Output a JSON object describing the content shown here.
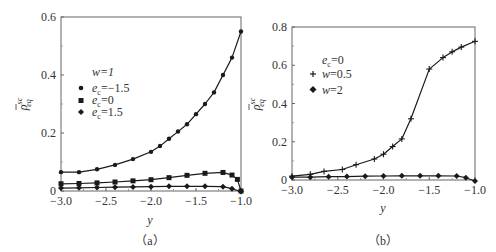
{
  "chart_data": [
    {
      "panel": "a",
      "type": "line",
      "caption": "（a）",
      "xlabel": "y",
      "ylabel": "ρ̄ sc eq",
      "xlim": [
        -3.0,
        -1.0
      ],
      "ylim": [
        0,
        0.6
      ],
      "xticks": [
        -3.0,
        -2.5,
        -2.0,
        -1.5,
        -1.0
      ],
      "xtick_labels": [
        "−3.0",
        "−2.5",
        "−2.0",
        "−1.5",
        "−1.0"
      ],
      "yticks": [
        0,
        0.2,
        0.4,
        0.6
      ],
      "ytick_labels": [
        "0",
        "0.2",
        "0.4",
        "0.6"
      ],
      "grid": false,
      "legend": {
        "title": "w=1",
        "position": "upper-left"
      },
      "series": [
        {
          "name": "ec=−1.5",
          "marker": "circle",
          "x": [
            -3.0,
            -2.8,
            -2.6,
            -2.4,
            -2.2,
            -2.0,
            -1.9,
            -1.8,
            -1.7,
            -1.6,
            -1.5,
            -1.4,
            -1.3,
            -1.2,
            -1.1,
            -1.0
          ],
          "values": [
            0.065,
            0.065,
            0.075,
            0.09,
            0.11,
            0.135,
            0.155,
            0.18,
            0.205,
            0.23,
            0.265,
            0.3,
            0.34,
            0.4,
            0.46,
            0.55
          ]
        },
        {
          "name": "ec=0",
          "marker": "square",
          "x": [
            -3.0,
            -2.8,
            -2.6,
            -2.4,
            -2.2,
            -2.0,
            -1.8,
            -1.6,
            -1.4,
            -1.2,
            -1.1,
            -1.04,
            -1.0
          ],
          "values": [
            0.025,
            0.026,
            0.028,
            0.031,
            0.035,
            0.039,
            0.046,
            0.054,
            0.061,
            0.064,
            0.055,
            0.04,
            0.0
          ]
        },
        {
          "name": "ec=1.5",
          "marker": "diamond",
          "x": [
            -3.0,
            -2.8,
            -2.6,
            -2.4,
            -2.2,
            -2.0,
            -1.8,
            -1.6,
            -1.4,
            -1.2,
            -1.1,
            -1.0
          ],
          "values": [
            0.01,
            0.011,
            0.012,
            0.013,
            0.014,
            0.015,
            0.016,
            0.016,
            0.016,
            0.015,
            0.008,
            -0.002
          ]
        }
      ]
    },
    {
      "panel": "b",
      "type": "line",
      "caption": "（b）",
      "xlabel": "y",
      "ylabel": "ρ̄ sc eq",
      "xlim": [
        -3.0,
        -1.0
      ],
      "ylim": [
        0,
        0.8
      ],
      "xticks": [
        -3.0,
        -2.5,
        -2.0,
        -1.5,
        -1.0
      ],
      "xtick_labels": [
        "−3.0",
        "−2.5",
        "−2.0",
        "−1.5",
        "−1.0"
      ],
      "yticks": [
        0,
        0.2,
        0.4,
        0.6,
        0.8
      ],
      "ytick_labels": [
        "0",
        "0.2",
        "0.4",
        "0.6",
        "0.8"
      ],
      "grid": false,
      "legend": {
        "title": "ec=0",
        "position": "upper-left"
      },
      "series": [
        {
          "name": "w=0.5",
          "marker": "plus",
          "x": [
            -3.0,
            -2.8,
            -2.65,
            -2.45,
            -2.3,
            -2.1,
            -2.0,
            -1.9,
            -1.8,
            -1.7,
            -1.5,
            -1.35,
            -1.25,
            -1.15,
            -1.0
          ],
          "values": [
            0.02,
            0.03,
            0.045,
            0.055,
            0.08,
            0.11,
            0.135,
            0.175,
            0.215,
            0.32,
            0.58,
            0.64,
            0.67,
            0.695,
            0.725
          ]
        },
        {
          "name": "w=2",
          "marker": "diamond",
          "x": [
            -3.0,
            -2.8,
            -2.6,
            -2.4,
            -2.2,
            -2.0,
            -1.8,
            -1.6,
            -1.4,
            -1.2,
            -1.1,
            -1.0
          ],
          "values": [
            0.015,
            0.015,
            0.017,
            0.018,
            0.02,
            0.021,
            0.022,
            0.022,
            0.022,
            0.021,
            0.012,
            -0.005
          ]
        }
      ]
    }
  ],
  "panels": {
    "a": {
      "caption": "（a）",
      "xlabel": "y",
      "ylabel_main": "ρ",
      "ylabel_sup": "sc",
      "ylabel_sub": "eq",
      "legend_title": "w=1",
      "legend_items": [
        {
          "label_base": "e",
          "label_sub": "c",
          "label_rest": "=−1.5"
        },
        {
          "label_base": "e",
          "label_sub": "c",
          "label_rest": "=0"
        },
        {
          "label_base": "e",
          "label_sub": "c",
          "label_rest": "=1.5"
        }
      ],
      "xtick_labels": [
        "−3.0",
        "−2.5",
        "−2.0",
        "−1.5",
        "−1.0"
      ],
      "ytick_labels": [
        "0",
        "0.2",
        "0.4",
        "0.6"
      ]
    },
    "b": {
      "caption": "（b）",
      "xlabel": "y",
      "ylabel_main": "ρ",
      "ylabel_sup": "sc",
      "ylabel_sub": "eq",
      "legend_title_base": "e",
      "legend_title_sub": "c",
      "legend_title_rest": "=0",
      "legend_items": [
        {
          "label_italic": "w",
          "label_rest": "=0.5"
        },
        {
          "label_italic": "w",
          "label_rest": "=2"
        }
      ],
      "xtick_labels": [
        "−3.0",
        "−2.5",
        "−2.0",
        "−1.5",
        "−1.0"
      ],
      "ytick_labels": [
        "0",
        "0.2",
        "0.4",
        "0.6",
        "0.8"
      ]
    }
  },
  "colors": {
    "line": "#1a1a1a",
    "axis": "#555555",
    "text": "#333333"
  }
}
